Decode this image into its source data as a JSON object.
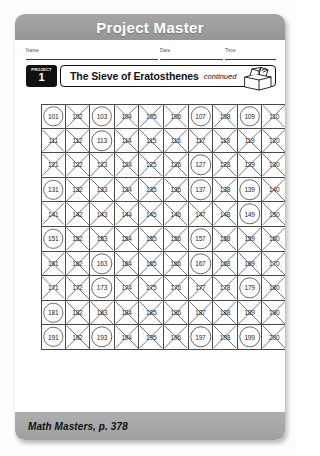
{
  "header": {
    "title": "Project Master"
  },
  "meta": {
    "name_label": "Name",
    "date_label": "Date",
    "time_label": "Time"
  },
  "title_row": {
    "badge_word": "PROJECT",
    "badge_number": "1",
    "title": "The Sieve of Eratosthenes",
    "continued": "continued",
    "icon": "open-box-icon"
  },
  "footer": {
    "text": "Math Masters, p. 378"
  },
  "colors": {
    "header_bar": "#9d9d9d",
    "footer_bar": "#a8a8a8",
    "badge": "#111111",
    "grid_line": "#4a4a4a",
    "mark": "#555555",
    "page": "#ffffff"
  },
  "grid": {
    "columns": 10,
    "rows": 10,
    "start": 101,
    "end": 200,
    "circled_label": "circled",
    "crossed_label": "crossed-out",
    "cells": [
      {
        "n": "101",
        "mark": "circle"
      },
      {
        "n": "102",
        "mark": "cross"
      },
      {
        "n": "103",
        "mark": "circle"
      },
      {
        "n": "104",
        "mark": "cross"
      },
      {
        "n": "105",
        "mark": "cross"
      },
      {
        "n": "106",
        "mark": "cross"
      },
      {
        "n": "107",
        "mark": "circle"
      },
      {
        "n": "108",
        "mark": "cross"
      },
      {
        "n": "109",
        "mark": "circle"
      },
      {
        "n": "110",
        "mark": "cross"
      },
      {
        "n": "111",
        "mark": "cross"
      },
      {
        "n": "112",
        "mark": "cross"
      },
      {
        "n": "113",
        "mark": "circle"
      },
      {
        "n": "114",
        "mark": "cross"
      },
      {
        "n": "115",
        "mark": "cross"
      },
      {
        "n": "116",
        "mark": "cross"
      },
      {
        "n": "117",
        "mark": "cross"
      },
      {
        "n": "118",
        "mark": "cross"
      },
      {
        "n": "119",
        "mark": "cross"
      },
      {
        "n": "120",
        "mark": "cross"
      },
      {
        "n": "121",
        "mark": "cross"
      },
      {
        "n": "122",
        "mark": "cross"
      },
      {
        "n": "123",
        "mark": "cross"
      },
      {
        "n": "124",
        "mark": "cross"
      },
      {
        "n": "125",
        "mark": "cross"
      },
      {
        "n": "126",
        "mark": "cross"
      },
      {
        "n": "127",
        "mark": "circle"
      },
      {
        "n": "128",
        "mark": "cross"
      },
      {
        "n": "129",
        "mark": "cross"
      },
      {
        "n": "130",
        "mark": "cross"
      },
      {
        "n": "131",
        "mark": "circle"
      },
      {
        "n": "132",
        "mark": "cross"
      },
      {
        "n": "133",
        "mark": "cross"
      },
      {
        "n": "134",
        "mark": "cross"
      },
      {
        "n": "135",
        "mark": "cross"
      },
      {
        "n": "136",
        "mark": "cross"
      },
      {
        "n": "137",
        "mark": "circle"
      },
      {
        "n": "138",
        "mark": "cross"
      },
      {
        "n": "139",
        "mark": "circle"
      },
      {
        "n": "140",
        "mark": "cross"
      },
      {
        "n": "141",
        "mark": "cross"
      },
      {
        "n": "142",
        "mark": "cross"
      },
      {
        "n": "143",
        "mark": "cross"
      },
      {
        "n": "144",
        "mark": "cross"
      },
      {
        "n": "145",
        "mark": "cross"
      },
      {
        "n": "146",
        "mark": "cross"
      },
      {
        "n": "147",
        "mark": "cross"
      },
      {
        "n": "148",
        "mark": "cross"
      },
      {
        "n": "149",
        "mark": "circle"
      },
      {
        "n": "150",
        "mark": "cross"
      },
      {
        "n": "151",
        "mark": "circle"
      },
      {
        "n": "152",
        "mark": "cross"
      },
      {
        "n": "153",
        "mark": "cross"
      },
      {
        "n": "154",
        "mark": "cross"
      },
      {
        "n": "155",
        "mark": "cross"
      },
      {
        "n": "156",
        "mark": "cross"
      },
      {
        "n": "157",
        "mark": "circle"
      },
      {
        "n": "158",
        "mark": "cross"
      },
      {
        "n": "159",
        "mark": "cross"
      },
      {
        "n": "160",
        "mark": "cross"
      },
      {
        "n": "161",
        "mark": "cross"
      },
      {
        "n": "162",
        "mark": "cross"
      },
      {
        "n": "163",
        "mark": "circle"
      },
      {
        "n": "164",
        "mark": "cross"
      },
      {
        "n": "165",
        "mark": "cross"
      },
      {
        "n": "166",
        "mark": "cross"
      },
      {
        "n": "167",
        "mark": "circle"
      },
      {
        "n": "168",
        "mark": "cross"
      },
      {
        "n": "169",
        "mark": "cross"
      },
      {
        "n": "170",
        "mark": "cross"
      },
      {
        "n": "171",
        "mark": "cross"
      },
      {
        "n": "172",
        "mark": "cross"
      },
      {
        "n": "173",
        "mark": "circle"
      },
      {
        "n": "174",
        "mark": "cross"
      },
      {
        "n": "175",
        "mark": "cross"
      },
      {
        "n": "176",
        "mark": "cross"
      },
      {
        "n": "177",
        "mark": "cross"
      },
      {
        "n": "178",
        "mark": "cross"
      },
      {
        "n": "179",
        "mark": "circle"
      },
      {
        "n": "180",
        "mark": "cross"
      },
      {
        "n": "181",
        "mark": "circle"
      },
      {
        "n": "182",
        "mark": "cross"
      },
      {
        "n": "183",
        "mark": "cross"
      },
      {
        "n": "184",
        "mark": "cross"
      },
      {
        "n": "185",
        "mark": "cross"
      },
      {
        "n": "186",
        "mark": "cross"
      },
      {
        "n": "187",
        "mark": "cross"
      },
      {
        "n": "188",
        "mark": "cross"
      },
      {
        "n": "189",
        "mark": "cross"
      },
      {
        "n": "190",
        "mark": "cross"
      },
      {
        "n": "191",
        "mark": "circle"
      },
      {
        "n": "192",
        "mark": "cross"
      },
      {
        "n": "193",
        "mark": "circle"
      },
      {
        "n": "194",
        "mark": "cross"
      },
      {
        "n": "195",
        "mark": "cross"
      },
      {
        "n": "196",
        "mark": "cross"
      },
      {
        "n": "197",
        "mark": "circle"
      },
      {
        "n": "198",
        "mark": "cross"
      },
      {
        "n": "199",
        "mark": "circle"
      },
      {
        "n": "200",
        "mark": "cross"
      }
    ]
  }
}
